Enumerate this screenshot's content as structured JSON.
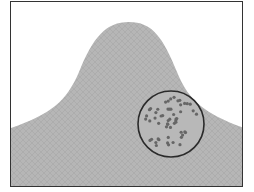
{
  "diagram": {
    "surface": {
      "fill": "#b4b4b4",
      "mesh_color": "#9a9a9a",
      "shape": "gaussian-peak"
    },
    "magnifier": {
      "cx": 160,
      "cy": 122,
      "r": 33,
      "stroke": "#2a2a2a",
      "dot_color": "#666666",
      "dot_count": 55
    },
    "frame": {
      "stroke": "#333333"
    }
  }
}
